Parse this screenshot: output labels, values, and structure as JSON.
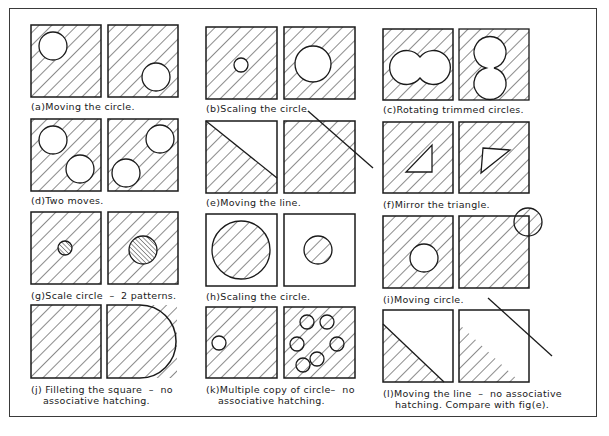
{
  "figure": {
    "colors": {
      "ink": "#1a1a1a",
      "frame": "#3a3a3a",
      "background": "#ffffff"
    },
    "panels": [
      {
        "id": "a",
        "caption_line1": "(a)Moving the circle.",
        "caption_line2": ""
      },
      {
        "id": "b",
        "caption_line1": "(b)Scaling the circle.",
        "caption_line2": ""
      },
      {
        "id": "c",
        "caption_line1": "(c)Rotating trimmed circles.",
        "caption_line2": ""
      },
      {
        "id": "d",
        "caption_line1": "(d)Two moves.",
        "caption_line2": ""
      },
      {
        "id": "e",
        "caption_line1": "(e)Moving the line.",
        "caption_line2": ""
      },
      {
        "id": "f",
        "caption_line1": "(f)Mirror the triangle.",
        "caption_line2": ""
      },
      {
        "id": "g",
        "caption_line1": "(g)Scale circle  –  2 patterns.",
        "caption_line2": ""
      },
      {
        "id": "h",
        "caption_line1": "(h)Scaling the circle.",
        "caption_line2": ""
      },
      {
        "id": "i",
        "caption_line1": "(i)Moving circle.",
        "caption_line2": ""
      },
      {
        "id": "j",
        "caption_line1": "(j) Filleting the square  –  no",
        "caption_line2": "associative hatching."
      },
      {
        "id": "k",
        "caption_line1": "(k)Multiple copy of circle–  no",
        "caption_line2": "associative hatching."
      },
      {
        "id": "l",
        "caption_line1": "(l)Moving the line  –  no associative",
        "caption_line2": "hatching. Compare with fig(e)."
      }
    ]
  }
}
